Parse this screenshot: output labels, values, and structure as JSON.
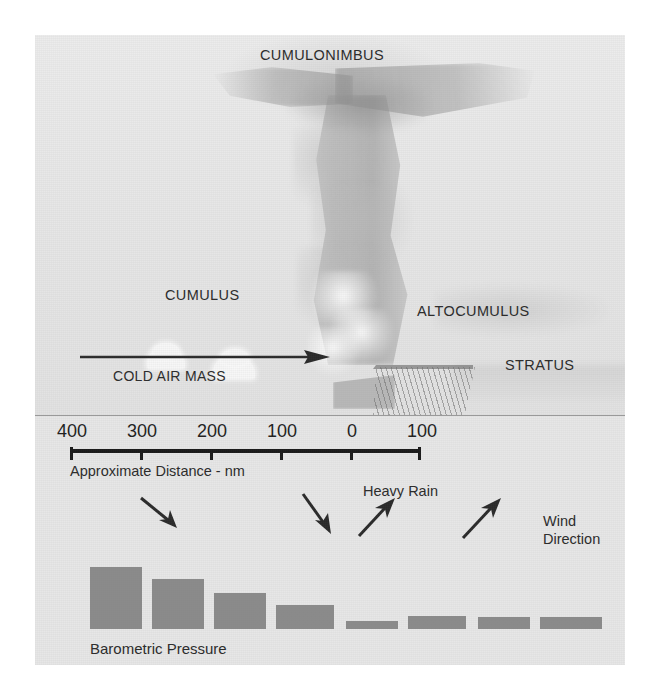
{
  "figure": {
    "colors": {
      "background": "#e9e9e9",
      "bar_fill": "#8b8b8b",
      "text": "#2b2b2b",
      "scale_line": "#1b1b1b",
      "arrow": "#2a2a2a"
    }
  },
  "cloud_labels": {
    "cumulonimbus": "CUMULONIMBUS",
    "cumulus": "CUMULUS",
    "altocumulus": "ALTOCUMULUS",
    "stratus": "STRATUS"
  },
  "air_mass": {
    "label": "COLD AIR MASS",
    "arrow_direction": "right"
  },
  "scale": {
    "caption": "Approximate Distance - nm",
    "unit": "nm",
    "tick_labels": [
      "400",
      "300",
      "200",
      "100",
      "0",
      "100"
    ],
    "tick_positions_px": [
      35,
      105,
      175,
      245,
      315,
      385
    ]
  },
  "annotations": {
    "heavy_rain": "Heavy Rain",
    "wind_direction_line1": "Wind",
    "wind_direction_line2": "Direction"
  },
  "wind_arrows": [
    {
      "name": "wind-arrow-1",
      "x": 130,
      "y": 40,
      "angle_deg": 40,
      "length": 40
    },
    {
      "name": "wind-arrow-2",
      "x": 290,
      "y": 36,
      "angle_deg": 55,
      "length": 44
    },
    {
      "name": "wind-arrow-3",
      "x": 348,
      "y": 70,
      "angle_deg": -50,
      "length": 44
    },
    {
      "name": "wind-arrow-4",
      "x": 450,
      "y": 72,
      "angle_deg": -50,
      "length": 46
    }
  ],
  "chart_data": {
    "type": "bar",
    "title": "Barometric Pressure",
    "label": "Barometric Pressure",
    "xlabel": "Approximate Distance - nm",
    "ylabel": "",
    "categories": [
      "400",
      "350",
      "300",
      "250",
      "200",
      "150",
      "100",
      "50"
    ],
    "values": [
      62,
      50,
      36,
      24,
      8,
      13,
      12,
      12
    ],
    "ylim": [
      0,
      70
    ],
    "grid": false,
    "legend": "none",
    "bar_color": "#8b8b8b",
    "bar_width_px": 52,
    "bar_gap_px": 10,
    "bars": [
      {
        "index": 1,
        "left": 55,
        "width": 52,
        "height": 62
      },
      {
        "index": 2,
        "left": 117,
        "width": 52,
        "height": 50
      },
      {
        "index": 3,
        "left": 179,
        "width": 52,
        "height": 36
      },
      {
        "index": 4,
        "left": 241,
        "width": 58,
        "height": 24
      },
      {
        "index": 5,
        "left": 311,
        "width": 52,
        "height": 8
      },
      {
        "index": 6,
        "left": 373,
        "width": 58,
        "height": 13
      },
      {
        "index": 7,
        "left": 443,
        "width": 52,
        "height": 12
      },
      {
        "index": 8,
        "left": 505,
        "width": 62,
        "height": 12
      }
    ]
  }
}
